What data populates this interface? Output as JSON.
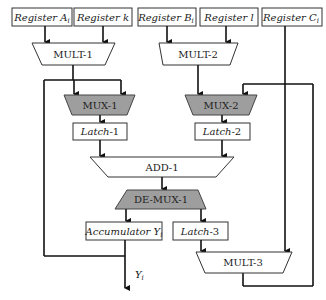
{
  "diagram": {
    "registers": [
      {
        "id": "reg-a",
        "label": "Register A",
        "sub": "i"
      },
      {
        "id": "reg-k",
        "label": "Register k",
        "sub": ""
      },
      {
        "id": "reg-b",
        "label": "Register B",
        "sub": "i"
      },
      {
        "id": "reg-l",
        "label": "Register l",
        "sub": ""
      },
      {
        "id": "reg-c",
        "label": "Register C",
        "sub": "i"
      }
    ],
    "blocks": {
      "mult1": "MULT-1",
      "mult2": "MULT-2",
      "mux1": "MUX-1",
      "mux2": "MUX-2",
      "latch1": {
        "name": "Latch",
        "num": "-1"
      },
      "latch2": {
        "name": "Latch",
        "num": "-2"
      },
      "add1": "ADD-1",
      "demux1": "DE-MUX-1",
      "accumulator": {
        "label": "Accumulator Y",
        "sub": "i"
      },
      "latch3": {
        "name": "Latch",
        "num": "-3"
      },
      "mult3": "MULT-3"
    },
    "output": {
      "label": "Y",
      "sub": "i"
    },
    "colors": {
      "gray_block": "#9e9e9e",
      "line": "#111111"
    }
  }
}
